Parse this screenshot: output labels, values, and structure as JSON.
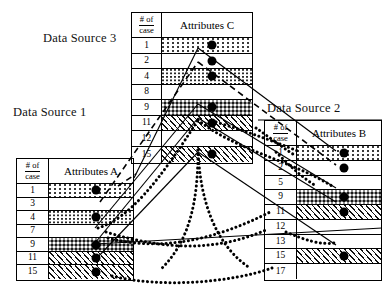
{
  "figure": {
    "background": "#ffffff",
    "ink": "#000000"
  },
  "labels": {
    "source1": "Data Source 1",
    "source2": "Data Source 2",
    "source3": "Data Source 3"
  },
  "header_text": {
    "num_line1": "# of",
    "num_line2": "case"
  },
  "tables": {
    "source3": {
      "name": "Data Source 3",
      "attr_header": "Attributes C",
      "x": 131,
      "y": 12,
      "width": 122,
      "height": 152,
      "num_col_width": 30,
      "rows": [
        {
          "case": "1",
          "fill": "dots-fine",
          "marker": true
        },
        {
          "case": "2",
          "fill": "none",
          "marker": true
        },
        {
          "case": "4",
          "fill": "dots-med",
          "marker": true
        },
        {
          "case": "8",
          "fill": "none",
          "marker": false
        },
        {
          "case": "9",
          "fill": "dots-dark",
          "marker": true
        },
        {
          "case": "11",
          "fill": "hatch",
          "marker": true
        },
        {
          "case": "12",
          "fill": "none",
          "marker": false
        },
        {
          "case": "15",
          "fill": "hatch",
          "marker": true
        }
      ]
    },
    "source1": {
      "name": "Data Source 1",
      "attr_header": "Attributes A",
      "x": 16,
      "y": 158,
      "width": 118,
      "height": 123,
      "num_col_width": 32,
      "rows": [
        {
          "case": "1",
          "fill": "dots-fine",
          "marker": true
        },
        {
          "case": "3",
          "fill": "none",
          "marker": false
        },
        {
          "case": "4",
          "fill": "dots-med",
          "marker": true
        },
        {
          "case": "7",
          "fill": "none",
          "marker": false
        },
        {
          "case": "9",
          "fill": "dots-dark",
          "marker": true
        },
        {
          "case": "11",
          "fill": "hatch",
          "marker": true
        },
        {
          "case": "15",
          "fill": "hatch",
          "marker": true
        }
      ]
    },
    "source2": {
      "name": "Data Source 2",
      "attr_header": "Attributes B",
      "x": 264,
      "y": 120,
      "width": 118,
      "height": 161,
      "num_col_width": 32,
      "rows": [
        {
          "case": "1",
          "fill": "dots-fine",
          "marker": true
        },
        {
          "case": "2",
          "fill": "none",
          "marker": true
        },
        {
          "case": "5",
          "fill": "none",
          "marker": false
        },
        {
          "case": "9",
          "fill": "dots-dark",
          "marker": true
        },
        {
          "case": "11",
          "fill": "hatch",
          "marker": true
        },
        {
          "case": "12",
          "fill": "none",
          "marker": false
        },
        {
          "case": "13",
          "fill": "none",
          "marker": false
        },
        {
          "case": "15",
          "fill": "hatch",
          "marker": true
        },
        {
          "case": "17",
          "fill": "none",
          "marker": false
        }
      ]
    }
  },
  "link_styles": {
    "solid": "solid-line",
    "dashed": "dashed-line",
    "dotted": "dotted-line"
  }
}
